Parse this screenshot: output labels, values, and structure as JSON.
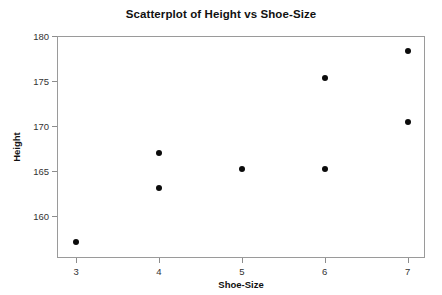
{
  "chart_data": {
    "type": "scatter",
    "title": "Scatterplot of Height vs Shoe-Size",
    "xlabel": "Shoe-Size",
    "ylabel": "Height",
    "x": [
      3,
      4,
      4,
      5,
      6,
      6,
      7,
      7
    ],
    "y": [
      157.1,
      167.0,
      163.1,
      165.2,
      175.3,
      165.2,
      178.3,
      170.4
    ],
    "points": [
      {
        "x": 3,
        "y": 157.1
      },
      {
        "x": 4,
        "y": 167.0
      },
      {
        "x": 4,
        "y": 163.1
      },
      {
        "x": 5,
        "y": 165.2
      },
      {
        "x": 6,
        "y": 175.3
      },
      {
        "x": 6,
        "y": 165.2
      },
      {
        "x": 7,
        "y": 178.3
      },
      {
        "x": 7,
        "y": 170.4
      }
    ],
    "xlim": [
      2.77,
      7.21
    ],
    "ylim": [
      155.3,
      180.0
    ],
    "xticks": [
      3,
      4,
      5,
      6,
      7
    ],
    "xtick_labels": [
      "3",
      "4",
      "5",
      "6",
      "7"
    ],
    "yticks": [
      160,
      165,
      170,
      175,
      180
    ],
    "ytick_labels": [
      "160",
      "165",
      "170",
      "175",
      "180"
    ],
    "grid": false,
    "legend": null,
    "marker": "filled-circle",
    "marker_color": "#0b0b0b",
    "frame_color": "#9a9a9a",
    "background": "#ffffff"
  }
}
